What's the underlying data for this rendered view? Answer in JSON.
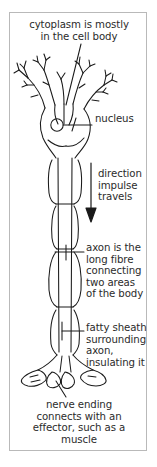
{
  "figure": {
    "border_color": "#b9b9b9",
    "background": "#ffffff",
    "ink_color": "#1a1a1a",
    "text_color": "#2b2b2b"
  },
  "labels": {
    "caption_top": "cytoplasm is mostly\nin the cell body",
    "nucleus": "nucleus",
    "direction": "direction\nimpulse\ntravels",
    "axon": "axon is the\nlong fibre\nconnecting\ntwo areas\nof the body",
    "fatty_sheath": "fatty sheath\nsurrounding\naxon,\ninsulating it",
    "caption_bottom": "nerve ending\nconnects with an\neffector, such as a\nmuscle"
  },
  "parts": {
    "dendrites": "dendrites",
    "cell_body": "cell-body",
    "nucleus": "nucleus",
    "axon": "axon",
    "myelin_sheath": "myelin-sheath",
    "nerve_endings": "nerve-endings",
    "impulse_arrow": "impulse-direction-arrow"
  }
}
